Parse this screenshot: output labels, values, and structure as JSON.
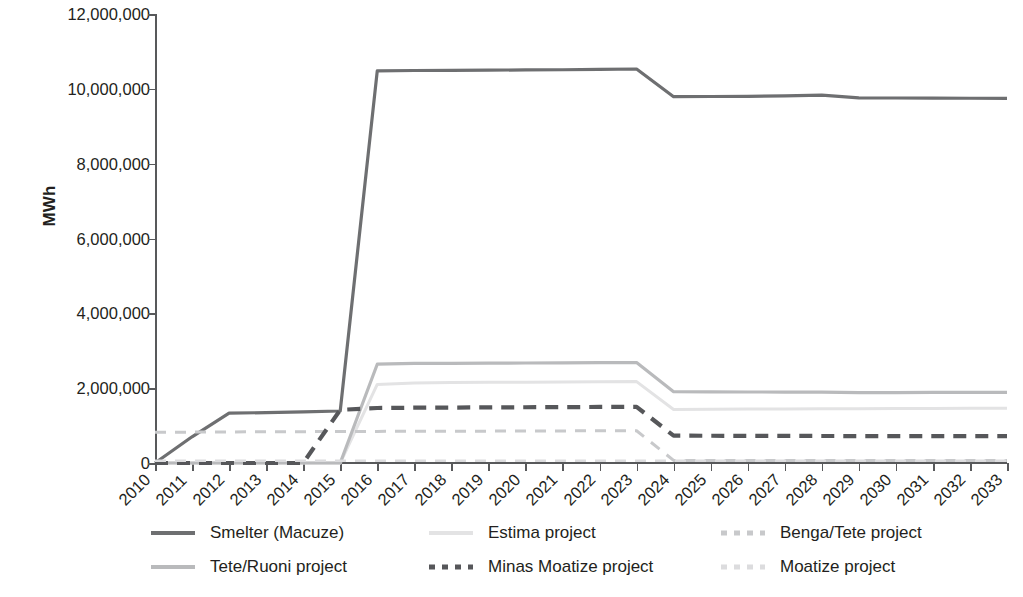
{
  "chart_data": {
    "type": "line",
    "title": "",
    "xlabel": "",
    "ylabel": "MWh",
    "grid": false,
    "legend_position": "bottom",
    "x": [
      2010,
      2011,
      2012,
      2013,
      2014,
      2015,
      2016,
      2017,
      2018,
      2019,
      2020,
      2021,
      2022,
      2023,
      2024,
      2025,
      2026,
      2027,
      2028,
      2029,
      2030,
      2031,
      2032,
      2033
    ],
    "xtick_labels": [
      "2010",
      "2011",
      "2012",
      "2013",
      "2014",
      "2015",
      "2016",
      "2017",
      "2018",
      "2019",
      "2020",
      "2021",
      "2022",
      "2023",
      "2024",
      "2025",
      "2026",
      "2027",
      "2028",
      "2029",
      "2030",
      "2031",
      "2032",
      "2033"
    ],
    "ytick_labels": [
      "12,000,000",
      "10,000,000",
      "8,000,000",
      "6,000,000",
      "4,000,000",
      "2,000,000",
      "0"
    ],
    "ytick_values": [
      12000000,
      10000000,
      8000000,
      6000000,
      4000000,
      2000000,
      0
    ],
    "ylim": [
      0,
      12000000
    ],
    "xlim": [
      2010,
      2033
    ],
    "series": [
      {
        "name": "Smelter (Macuze)",
        "color": "#6e6f71",
        "style": "solid",
        "width": 3.2,
        "values": [
          0,
          700000,
          1335000,
          1345000,
          1365000,
          1390000,
          10480000,
          10490000,
          10495000,
          10500000,
          10505000,
          10510000,
          10520000,
          10530000,
          9790000,
          9795000,
          9800000,
          9810000,
          9830000,
          9760000,
          9755000,
          9750000,
          9748000,
          9745000
        ]
      },
      {
        "name": "Estima project",
        "color": "#e3e3e4",
        "style": "solid",
        "width": 3.0,
        "values": [
          0,
          0,
          0,
          0,
          0,
          0,
          2100000,
          2140000,
          2150000,
          2155000,
          2160000,
          2165000,
          2170000,
          2175000,
          1430000,
          1435000,
          1440000,
          1445000,
          1450000,
          1452000,
          1455000,
          1458000,
          1460000,
          1462000
        ]
      },
      {
        "name": "Benga/Tete project",
        "color": "#c8c9cb",
        "style": "dashed",
        "width": 3.0,
        "values": [
          820000,
          825000,
          830000,
          835000,
          838000,
          840000,
          845000,
          848000,
          850000,
          852000,
          855000,
          858000,
          860000,
          862000,
          70000,
          70000,
          70000,
          70000,
          70000,
          70000,
          70000,
          70000,
          70000,
          70000
        ]
      },
      {
        "name": "Tete/Ruoni project",
        "color": "#b9babc",
        "style": "solid",
        "width": 3.2,
        "values": [
          0,
          0,
          0,
          0,
          0,
          0,
          2640000,
          2660000,
          2665000,
          2668000,
          2672000,
          2676000,
          2680000,
          2685000,
          1905000,
          1900000,
          1898000,
          1896000,
          1894000,
          1880000,
          1882000,
          1885000,
          1888000,
          1890000
        ]
      },
      {
        "name": "Minas Moatize project",
        "color": "#56575a",
        "style": "dashed",
        "width": 4.2,
        "values": [
          0,
          0,
          0,
          0,
          0,
          1420000,
          1470000,
          1478000,
          1482000,
          1486000,
          1490000,
          1494000,
          1498000,
          1502000,
          730000,
          728000,
          726000,
          724000,
          722000,
          720000,
          719000,
          718000,
          717000,
          716000
        ]
      },
      {
        "name": "Moatize project",
        "color": "#dcdcde",
        "style": "dashed",
        "width": 2.6,
        "values": [
          60000,
          60000,
          60000,
          60000,
          60000,
          60000,
          62000,
          62000,
          62000,
          62000,
          62000,
          62000,
          62000,
          62000,
          60000,
          60000,
          60000,
          60000,
          60000,
          60000,
          60000,
          60000,
          60000,
          60000
        ]
      }
    ]
  },
  "legend": {
    "items": [
      {
        "label": "Smelter (Macuze)",
        "color": "#6e6f71",
        "style": "solid"
      },
      {
        "label": "Estima project",
        "color": "#e3e3e4",
        "style": "solid"
      },
      {
        "label": "Benga/Tete project",
        "color": "#c8c9cb",
        "style": "dashed"
      },
      {
        "label": "Tete/Ruoni project",
        "color": "#b9babc",
        "style": "solid"
      },
      {
        "label": "Minas Moatize project",
        "color": "#56575a",
        "style": "dashed"
      },
      {
        "label": "Moatize project",
        "color": "#dcdcde",
        "style": "dashed"
      }
    ]
  },
  "axis": {
    "color": "#58595b"
  }
}
